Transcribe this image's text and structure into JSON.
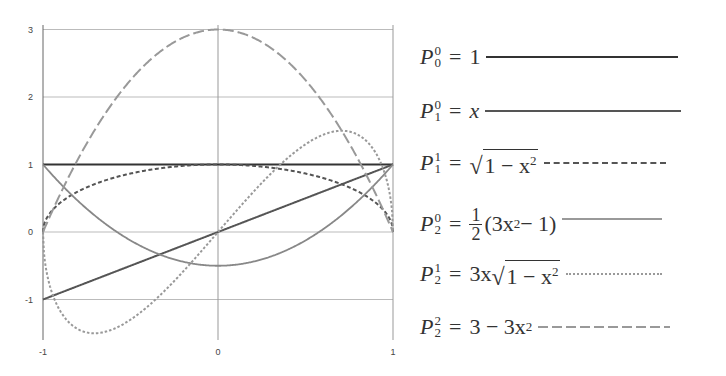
{
  "chart_data": {
    "type": "line",
    "title": "",
    "xlabel": "",
    "ylabel": "",
    "xlim": [
      -1,
      1
    ],
    "ylim": [
      -1.5,
      3
    ],
    "grid": true,
    "legend_position": "right",
    "x_ticks": [
      "-1",
      "0",
      "1"
    ],
    "y_ticks": [
      "3",
      "2",
      "1",
      "0",
      "-1"
    ],
    "x": [
      -1,
      -0.75,
      -0.5,
      -0.25,
      0,
      0.25,
      0.5,
      0.75,
      1
    ],
    "series": [
      {
        "name": "P_0^0 = 1",
        "style": "solid-dark",
        "color": "#333333",
        "values": [
          1,
          1,
          1,
          1,
          1,
          1,
          1,
          1,
          1
        ]
      },
      {
        "name": "P_1^0 = x",
        "style": "solid",
        "color": "#555555",
        "values": [
          -1,
          -0.75,
          -0.5,
          -0.25,
          0,
          0.25,
          0.5,
          0.75,
          1
        ]
      },
      {
        "name": "P_1^1 = sqrt(1 - x^2)",
        "style": "dashed-short",
        "color": "#555555",
        "values": [
          0,
          0.661,
          0.866,
          0.968,
          1,
          0.968,
          0.866,
          0.661,
          0
        ]
      },
      {
        "name": "P_2^0 = 1/2 (3x^2 - 1)",
        "style": "solid-light",
        "color": "#888888",
        "values": [
          1,
          0.344,
          -0.125,
          -0.406,
          -0.5,
          -0.406,
          -0.125,
          0.344,
          1
        ]
      },
      {
        "name": "P_2^1 = 3x sqrt(1 - x^2)",
        "style": "dotted",
        "color": "#999999",
        "values": [
          0,
          -1.488,
          -1.299,
          -0.726,
          0,
          0.726,
          1.299,
          1.488,
          0
        ]
      },
      {
        "name": "P_2^2 = 3 - 3x^2",
        "style": "dashed-long",
        "color": "#999999",
        "values": [
          0,
          1.313,
          2.25,
          2.813,
          3,
          2.813,
          2.25,
          1.313,
          0
        ]
      }
    ]
  },
  "axes": {
    "x_ticks": [
      {
        "label": "-1",
        "v": -1
      },
      {
        "label": "0",
        "v": 0
      },
      {
        "label": "1",
        "v": 1
      }
    ],
    "y_ticks": [
      {
        "label": "3",
        "v": 3
      },
      {
        "label": "2",
        "v": 2
      },
      {
        "label": "1",
        "v": 1
      },
      {
        "label": "0",
        "v": 0
      },
      {
        "label": "-1",
        "v": -1
      }
    ]
  },
  "legend": {
    "items": [
      {
        "P": "P",
        "sup": "0",
        "sub": "0",
        "eq": "=",
        "rhs": "1"
      },
      {
        "P": "P",
        "sup": "0",
        "sub": "1",
        "eq": "=",
        "rhs": "x"
      },
      {
        "P": "P",
        "sup": "1",
        "sub": "1",
        "eq": "=",
        "rhs_prefix": "",
        "radicand": "1 − x",
        "radicand_exp": "2"
      },
      {
        "P": "P",
        "sup": "0",
        "sub": "2",
        "eq": "=",
        "frac_num": "1",
        "frac_den": "2",
        "rhs": "(3x",
        "rhs_exp": "2",
        "rhs_tail": " − 1)"
      },
      {
        "P": "P",
        "sup": "1",
        "sub": "2",
        "eq": "=",
        "rhs_prefix": "3x",
        "radicand": "1 − x",
        "radicand_exp": "2"
      },
      {
        "P": "P",
        "sup": "2",
        "sub": "2",
        "eq": "=",
        "rhs": "3 − 3x",
        "rhs_exp": "2"
      }
    ]
  }
}
